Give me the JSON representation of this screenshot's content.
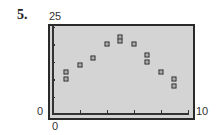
{
  "problem_number": "5.",
  "axis_labels": {
    "ymax": "25",
    "ymin": "0",
    "xmin": "0",
    "xmax": "10"
  },
  "chart_data": {
    "type": "scatter",
    "title": "",
    "xlabel": "",
    "ylabel": "",
    "xlim": [
      0,
      10
    ],
    "ylim": [
      0,
      25
    ],
    "xticks": [
      0,
      2,
      4,
      6,
      8,
      10
    ],
    "yticks": [
      0,
      5,
      10,
      15,
      20,
      25
    ],
    "grid": false,
    "legend": null,
    "points": [
      {
        "x": 1,
        "y": 12
      },
      {
        "x": 1,
        "y": 10
      },
      {
        "x": 2,
        "y": 14
      },
      {
        "x": 3,
        "y": 16
      },
      {
        "x": 4,
        "y": 20
      },
      {
        "x": 5,
        "y": 22
      },
      {
        "x": 5,
        "y": 21
      },
      {
        "x": 6,
        "y": 20
      },
      {
        "x": 7,
        "y": 17
      },
      {
        "x": 7,
        "y": 15
      },
      {
        "x": 8,
        "y": 12
      },
      {
        "x": 9,
        "y": 10
      },
      {
        "x": 9,
        "y": 8
      }
    ]
  },
  "colors": {
    "plot_background": "#d4d4d4",
    "frame": "#2a2a2a",
    "marker": "#222222"
  }
}
